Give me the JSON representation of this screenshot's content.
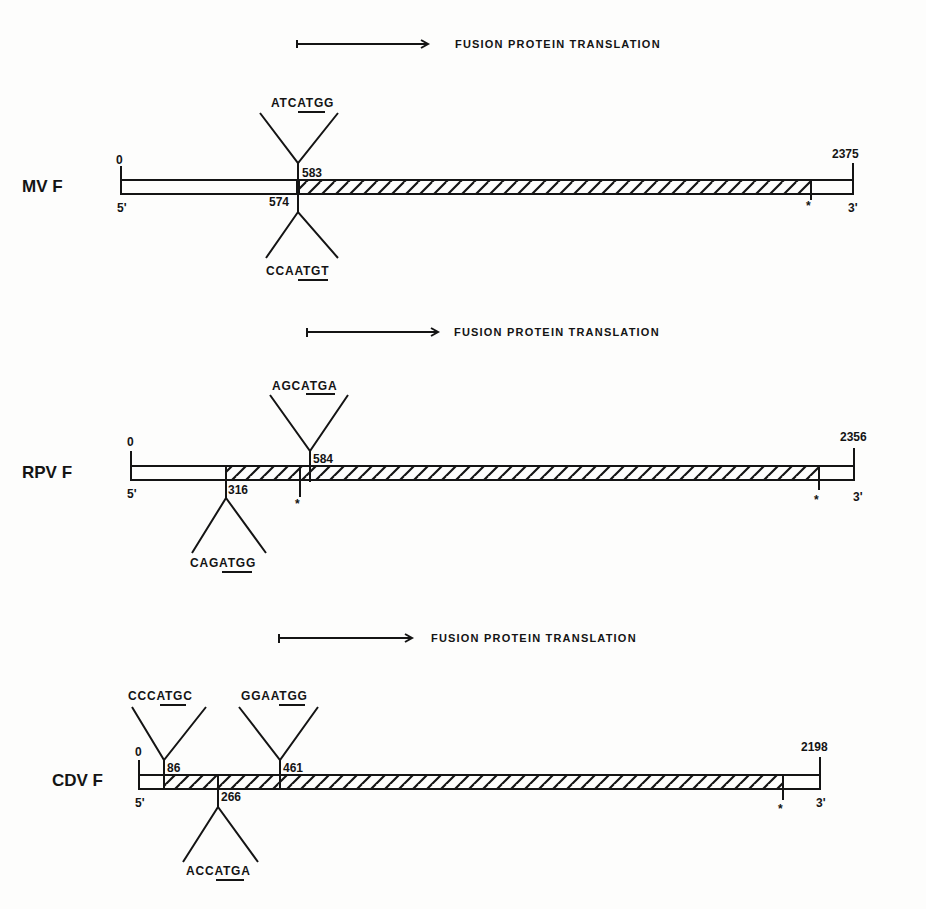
{
  "figure": {
    "header_label": "FUSION PROTEIN TRANSLATION",
    "hatch_meaning": "fusion protein coding region",
    "stop_codon_symbol": "*",
    "strand_labels": {
      "left": "5'",
      "right": "3'"
    },
    "colors": {
      "ink": "#141414",
      "paper": "#fdfdfc"
    }
  },
  "genes": [
    {
      "name": "MV F",
      "start_label": "0",
      "end_label": "2375",
      "five_prime": "5'",
      "three_prime": "3'",
      "translation_header": "FUSION PROTEIN TRANSLATION",
      "sites": [
        {
          "position": "583",
          "sequence": "ATCATGG",
          "side": "above"
        },
        {
          "position": "574",
          "sequence": "CCAATGT",
          "side": "below"
        }
      ],
      "stop_markers": [
        "*"
      ]
    },
    {
      "name": "RPV F",
      "start_label": "0",
      "end_label": "2356",
      "five_prime": "5'",
      "three_prime": "3'",
      "translation_header": "FUSION PROTEIN TRANSLATION",
      "sites": [
        {
          "position": "584",
          "sequence": "AGCATGA",
          "side": "above"
        },
        {
          "position": "316",
          "sequence": "CAGATGG",
          "side": "below"
        }
      ],
      "stop_markers": [
        "*",
        "*"
      ]
    },
    {
      "name": "CDV F",
      "start_label": "0",
      "end_label": "2198",
      "five_prime": "5'",
      "three_prime": "3'",
      "translation_header": "FUSION PROTEIN TRANSLATION",
      "sites": [
        {
          "position": "86",
          "sequence": "CCCATGC",
          "side": "above"
        },
        {
          "position": "461",
          "sequence": "GGAATGG",
          "side": "above"
        },
        {
          "position": "266",
          "sequence": "ACCATGA",
          "side": "below"
        }
      ],
      "stop_markers": [
        "*"
      ]
    }
  ]
}
